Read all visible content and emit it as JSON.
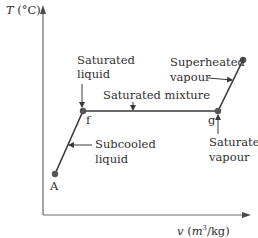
{
  "diagram": {
    "type": "T-v phase diagram",
    "y_axis": {
      "symbol": "T",
      "unit": "(°C)"
    },
    "x_axis": {
      "symbol": "v",
      "unit_open": "(",
      "unit_m": "m",
      "unit_sup": "3",
      "unit_rest": "/kg)"
    },
    "points": [
      {
        "id": "A",
        "label": "A"
      },
      {
        "id": "f",
        "label": "f"
      },
      {
        "id": "g",
        "label": "g"
      },
      {
        "id": "end",
        "label": ""
      }
    ],
    "annotations": {
      "saturated_liquid": [
        "Saturated",
        "liquid"
      ],
      "saturated_mixture": "Saturated mixture",
      "superheated_vapour": [
        "Superheated",
        "vapour"
      ],
      "subcooled_liquid": [
        "Subcooled",
        "liquid"
      ],
      "saturated_vapour": [
        "Saturated",
        "vapour"
      ]
    },
    "colors": {
      "line": "#3a3a3a",
      "point": "#555555",
      "axis": "#6a6a6a",
      "text": "#2f2f2f"
    }
  }
}
